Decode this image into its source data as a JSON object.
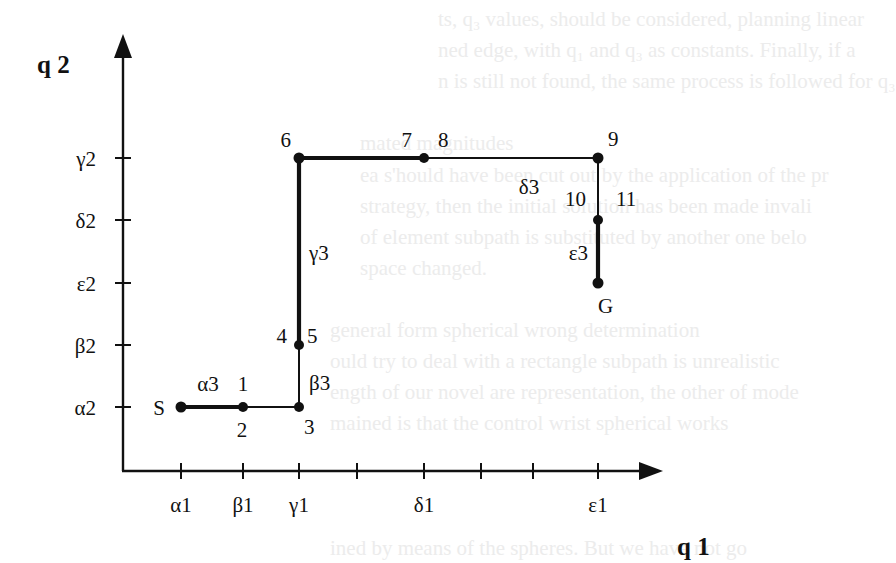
{
  "figure": {
    "type": "configuration-space path diagram",
    "axis_x_title": "q 1",
    "axis_y_title": "q 2",
    "x_ticks": [
      {
        "label": "α1",
        "pos": 1
      },
      {
        "label": "β1",
        "pos": 2
      },
      {
        "label": "γ1",
        "pos": 3
      },
      {
        "label": "",
        "pos": 4
      },
      {
        "label": "δ1",
        "pos": 5
      },
      {
        "label": "",
        "pos": 6
      },
      {
        "label": "",
        "pos": 7
      },
      {
        "label": "ε1",
        "pos": 8
      }
    ],
    "y_ticks": [
      {
        "label": "α2",
        "pos": 1
      },
      {
        "label": "β2",
        "pos": 2
      },
      {
        "label": "ε2",
        "pos": 3
      },
      {
        "label": "δ2",
        "pos": 4
      },
      {
        "label": "γ2",
        "pos": 5
      }
    ],
    "nodes": [
      {
        "id": "S",
        "x": 1,
        "y": 1,
        "labels": [
          {
            "text": "S",
            "side": "left"
          }
        ]
      },
      {
        "id": "n1-2",
        "x": 2,
        "y": 1,
        "labels": [
          {
            "text": "1",
            "side": "top"
          },
          {
            "text": "2",
            "side": "bottom"
          }
        ]
      },
      {
        "id": "n3",
        "x": 3,
        "y": 1,
        "labels": [
          {
            "text": "3",
            "side": "bottom-right"
          }
        ]
      },
      {
        "id": "n4-5",
        "x": 3,
        "y": 2,
        "labels": [
          {
            "text": "4",
            "side": "top-left"
          },
          {
            "text": "5",
            "side": "top-right"
          }
        ]
      },
      {
        "id": "n6",
        "x": 3,
        "y": 5,
        "labels": [
          {
            "text": "6",
            "side": "top-left"
          }
        ]
      },
      {
        "id": "n7-8",
        "x": 5,
        "y": 5,
        "labels": [
          {
            "text": "7",
            "side": "top-left"
          },
          {
            "text": "8",
            "side": "top-right"
          }
        ]
      },
      {
        "id": "n9",
        "x": 8,
        "y": 5,
        "labels": [
          {
            "text": "9",
            "side": "top-right"
          }
        ]
      },
      {
        "id": "n10-11",
        "x": 8,
        "y": 4,
        "labels": [
          {
            "text": "10",
            "side": "top-left"
          },
          {
            "text": "11",
            "side": "top-right"
          }
        ]
      },
      {
        "id": "G",
        "x": 8,
        "y": 3,
        "labels": [
          {
            "text": "G",
            "side": "bottom-right"
          }
        ]
      }
    ],
    "segments": [
      {
        "from": "S",
        "to": "n1-2",
        "weight": "bold",
        "label": "α3",
        "label_side": "above"
      },
      {
        "from": "n1-2",
        "to": "n3",
        "weight": "thin",
        "label": "",
        "label_side": ""
      },
      {
        "from": "n3",
        "to": "n4-5",
        "weight": "thin",
        "label": "β3",
        "label_side": "right"
      },
      {
        "from": "n4-5",
        "to": "n6",
        "weight": "bold",
        "label": "γ3",
        "label_side": "right"
      },
      {
        "from": "n6",
        "to": "n7-8",
        "weight": "bold",
        "label": "",
        "label_side": ""
      },
      {
        "from": "n7-8",
        "to": "n9",
        "weight": "thin",
        "label": "δ3",
        "label_side": "below"
      },
      {
        "from": "n9",
        "to": "n10-11",
        "weight": "thin",
        "label": "",
        "label_side": ""
      },
      {
        "from": "n10-11",
        "to": "G",
        "weight": "bold",
        "label": "ε3",
        "label_side": "left"
      }
    ]
  },
  "background_text": [
    "ts, q₃ values, should be considered, planning linear",
    "ned edge, with q₁ and q₃ as constants. Finally, if a",
    "n is still not found, the same process is followed for q₃",
    "",
    "mated magnitudes",
    "ea s'hould have been cut out by the application of the pr",
    "strategy, then the initial solution has been made invali",
    "of element subpath is substituted by another one belo",
    "space changed.",
    "",
    "general form spherical wrong determination",
    "ould try to deal with a rectangle subpath is unrealistic",
    "ength of our novel are representation, the other of mode",
    "mained is that the control wrist spherical works",
    "ined by means of the spheres. But we have not go"
  ]
}
